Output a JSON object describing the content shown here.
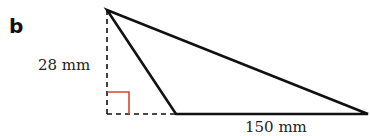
{
  "part_label": "b",
  "diagram": {
    "type": "obtuse-triangle-with-height",
    "height_label": "28 mm",
    "base_label": "150 mm",
    "colors": {
      "stroke": "#111111",
      "right_angle": "#d9472b",
      "dashed": "#111111"
    }
  }
}
